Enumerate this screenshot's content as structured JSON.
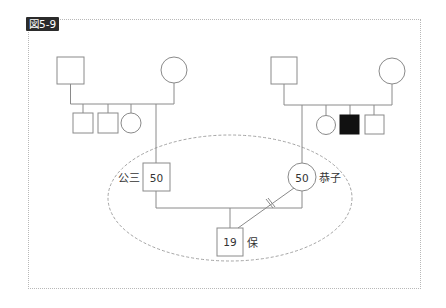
{
  "figure": {
    "label": "図5-9"
  },
  "pedigree": {
    "colors": {
      "line": "#8a8a8a",
      "affected_fill": "#111111",
      "text": "#333333",
      "ellipse": "#9a9a9a",
      "frame": "#b8b8b8"
    },
    "left_family": {
      "grandfather": {
        "symbol": "square"
      },
      "grandmother": {
        "symbol": "circle"
      },
      "siblings": [
        {
          "symbol": "square"
        },
        {
          "symbol": "square"
        },
        {
          "symbol": "circle"
        }
      ]
    },
    "right_family": {
      "grandfather": {
        "symbol": "square"
      },
      "grandmother": {
        "symbol": "circle"
      },
      "siblings": [
        {
          "symbol": "circle"
        },
        {
          "symbol": "square",
          "affected": true
        },
        {
          "symbol": "square"
        }
      ]
    },
    "father": {
      "name": "公三",
      "age": "50",
      "symbol": "square"
    },
    "mother": {
      "name": "恭子",
      "age": "50",
      "symbol": "circle"
    },
    "child": {
      "name": "保",
      "age": "19",
      "symbol": "square"
    },
    "relationship": {
      "mother_child": "severed-line",
      "household": "dashed-ellipse"
    }
  }
}
